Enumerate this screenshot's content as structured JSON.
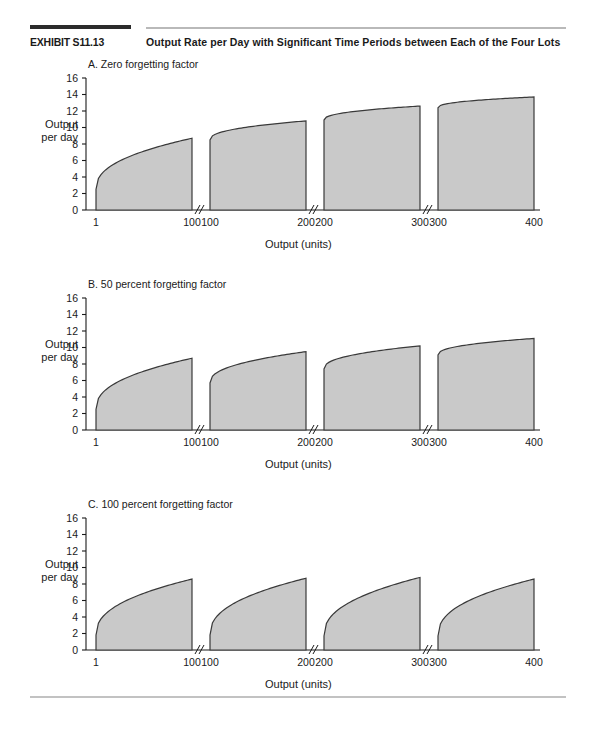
{
  "exhibit": {
    "label": "EXHIBIT S11.13",
    "title": "Output Rate per Day with Significant Time Periods between Each of the Four Lots"
  },
  "axis_labels": {
    "y_line1": "Output",
    "y_line2": "per day",
    "x_title": "Output (units)"
  },
  "y_ticks": [
    "0",
    "2",
    "4",
    "6",
    "8",
    "10",
    "12",
    "14",
    "16"
  ],
  "segment_x_labels": [
    [
      "1",
      "100"
    ],
    [
      "100",
      "200"
    ],
    [
      "200",
      "300"
    ],
    [
      "300",
      "400"
    ]
  ],
  "colors": {
    "area_fill": "#c9c9c9",
    "area_stroke": "#3a3a3a",
    "axis": "#1a1a1a",
    "rule_dark": "#2b2b2b",
    "rule_light": "#b9b9b9"
  },
  "chart_data": [
    {
      "type": "area",
      "title": "A. Zero forgetting factor",
      "xlabel": "Output (units)",
      "ylabel": "Output per day",
      "ylim": [
        0,
        16
      ],
      "ytick_step": 2,
      "grid": false,
      "axis_breaks": true,
      "segments": [
        {
          "name": "Lot 1",
          "x_range": [
            1,
            100
          ],
          "y_start": 2.5,
          "y_end": 8.7
        },
        {
          "name": "Lot 2",
          "x_range": [
            100,
            200
          ],
          "y_start": 8.5,
          "y_end": 10.8
        },
        {
          "name": "Lot 3",
          "x_range": [
            200,
            300
          ],
          "y_start": 10.9,
          "y_end": 12.6
        },
        {
          "name": "Lot 4",
          "x_range": [
            300,
            400
          ],
          "y_start": 12.4,
          "y_end": 13.7
        }
      ]
    },
    {
      "type": "area",
      "title": "B. 50 percent forgetting factor",
      "xlabel": "Output (units)",
      "ylabel": "Output per day",
      "ylim": [
        0,
        16
      ],
      "ytick_step": 2,
      "grid": false,
      "axis_breaks": true,
      "segments": [
        {
          "name": "Lot 1",
          "x_range": [
            1,
            100
          ],
          "y_start": 2.5,
          "y_end": 8.7
        },
        {
          "name": "Lot 2",
          "x_range": [
            100,
            200
          ],
          "y_start": 5.7,
          "y_end": 9.5
        },
        {
          "name": "Lot 3",
          "x_range": [
            200,
            300
          ],
          "y_start": 7.4,
          "y_end": 10.2
        },
        {
          "name": "Lot 4",
          "x_range": [
            300,
            400
          ],
          "y_start": 9.1,
          "y_end": 11.1
        }
      ]
    },
    {
      "type": "area",
      "title": "C. 100 percent forgetting factor",
      "xlabel": "Output (units)",
      "ylabel": "Output per day",
      "ylim": [
        0,
        16
      ],
      "ytick_step": 2,
      "grid": false,
      "axis_breaks": true,
      "segments": [
        {
          "name": "Lot 1",
          "x_range": [
            1,
            100
          ],
          "y_start": 1.8,
          "y_end": 8.6
        },
        {
          "name": "Lot 2",
          "x_range": [
            100,
            200
          ],
          "y_start": 1.8,
          "y_end": 8.7
        },
        {
          "name": "Lot 3",
          "x_range": [
            200,
            300
          ],
          "y_start": 1.7,
          "y_end": 8.8
        },
        {
          "name": "Lot 4",
          "x_range": [
            300,
            400
          ],
          "y_start": 1.7,
          "y_end": 8.6
        }
      ]
    }
  ],
  "panel_layout": [
    {
      "top": 58,
      "title_left": 88,
      "title_top": 58,
      "plot_top": 78,
      "ylabel_top": 118,
      "xlabel_top": 242
    },
    {
      "top": 278,
      "title_left": 88,
      "title_top": 278,
      "plot_top": 298,
      "ylabel_top": 338,
      "xlabel_top": 462
    },
    {
      "top": 498,
      "title_left": 88,
      "title_top": 498,
      "plot_top": 518,
      "ylabel_top": 558,
      "xlabel_top": 682
    }
  ]
}
